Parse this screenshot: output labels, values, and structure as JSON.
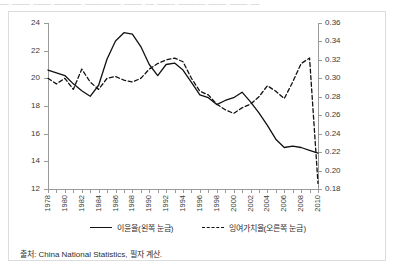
{
  "title_strip": "— —— —— ——— ———— —— — —— ——— —— —— —",
  "source": "출처: China National Statistics, 필자 계산.",
  "legend": {
    "position": "bottom-center",
    "items": [
      {
        "label": "이윤율(왼쪽 눈금)",
        "style": "solid"
      },
      {
        "label": "잉여가치율(오른쪽 눈금)",
        "style": "dashed"
      }
    ]
  },
  "chart_data": {
    "type": "line",
    "title": "",
    "xlabel": "",
    "grid": false,
    "legend_position": "bottom-center",
    "x": [
      1978,
      1979,
      1980,
      1981,
      1982,
      1983,
      1984,
      1985,
      1986,
      1987,
      1988,
      1989,
      1990,
      1991,
      1992,
      1993,
      1994,
      1995,
      1996,
      1997,
      1998,
      1999,
      2000,
      2001,
      2002,
      2003,
      2004,
      2005,
      2006,
      2007,
      2008,
      2009,
      2010
    ],
    "xtick_labels": [
      "1978",
      "1980",
      "1982",
      "1984",
      "1986",
      "1988",
      "1990",
      "1992",
      "1994",
      "1996",
      "1998",
      "2000",
      "2002",
      "2004",
      "2006",
      "2008",
      "2010"
    ],
    "xtick_values": [
      1978,
      1980,
      1982,
      1984,
      1986,
      1988,
      1990,
      1992,
      1994,
      1996,
      1998,
      2000,
      2002,
      2004,
      2006,
      2008,
      2010
    ],
    "xlim": [
      1978,
      2010
    ],
    "axes": [
      {
        "side": "left",
        "ylabel": "",
        "ylim": [
          12,
          24
        ],
        "ytick_values": [
          12,
          14,
          16,
          18,
          20,
          22,
          24
        ],
        "ytick_labels": [
          "12",
          "14",
          "16",
          "18",
          "20",
          "22",
          "24"
        ]
      },
      {
        "side": "right",
        "ylabel": "",
        "ylim": [
          0.18,
          0.36
        ],
        "ytick_values": [
          0.18,
          0.2,
          0.22,
          0.24,
          0.26,
          0.28,
          0.3,
          0.32,
          0.34,
          0.36
        ],
        "ytick_labels": [
          "0.18",
          "0.20",
          "0.22",
          "0.24",
          "0.26",
          "0.28",
          "0.30",
          "0.32",
          "0.34",
          "0.36"
        ]
      }
    ],
    "series": [
      {
        "name": "이윤율(왼쪽 눈금)",
        "axis": "left",
        "style": "solid",
        "color": "#111111",
        "values": [
          20.6,
          20.4,
          20.2,
          19.6,
          19.1,
          18.7,
          19.5,
          21.4,
          22.7,
          23.3,
          23.2,
          22.3,
          21.0,
          20.2,
          21.0,
          21.1,
          20.6,
          19.7,
          18.8,
          18.6,
          18.1,
          18.4,
          18.6,
          19.0,
          18.3,
          17.5,
          16.6,
          15.6,
          15.0,
          15.1,
          15.0,
          14.8,
          14.6
        ]
      },
      {
        "name": "잉여가치율(오른쪽 눈금)",
        "axis": "right",
        "style": "dashed",
        "color": "#111111",
        "values": [
          0.3,
          0.294,
          0.3,
          0.288,
          0.31,
          0.296,
          0.288,
          0.3,
          0.302,
          0.298,
          0.296,
          0.3,
          0.31,
          0.316,
          0.32,
          0.322,
          0.318,
          0.3,
          0.286,
          0.282,
          0.272,
          0.266,
          0.262,
          0.268,
          0.272,
          0.28,
          0.292,
          0.286,
          0.278,
          0.296,
          0.316,
          0.322,
          0.186
        ]
      }
    ]
  }
}
